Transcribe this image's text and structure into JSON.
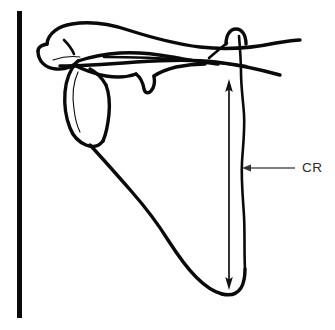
{
  "figure": {
    "background_color": "#ffffff",
    "width": 335,
    "height": 330,
    "line_color": "#0a0a0a"
  },
  "receptor": {
    "name": "image receptor",
    "color": "#0a0a0a",
    "x": 17,
    "y_top": 11,
    "y_bottom": 318,
    "thickness": 5
  },
  "annotations": {
    "cr": {
      "label": "CR",
      "label_color": "#2b2b2b",
      "label_x": 302,
      "label_y": 168,
      "leader_from_x": 295,
      "leader_to_x": 245,
      "leader_y": 168
    }
  },
  "cr_arrow": {
    "name": "central-ray-double-arrow",
    "color": "#111111",
    "x": 229,
    "y_top": 80,
    "y_bottom": 289,
    "double_headed": true
  },
  "anatomy": {
    "parts": [
      {
        "name": "clavicle",
        "label": "Clavicle"
      },
      {
        "name": "acromion",
        "label": "Acromion process"
      },
      {
        "name": "coracoid",
        "label": "Coracoid process"
      },
      {
        "name": "glenoid",
        "label": "Glenoid fossa"
      },
      {
        "name": "scapular-spine",
        "label": "Scapular spine"
      },
      {
        "name": "medial-border",
        "label": "Medial (vertebral) border"
      },
      {
        "name": "lateral-border",
        "label": "Lateral (axillary) border"
      },
      {
        "name": "inferior-angle",
        "label": "Inferior angle"
      },
      {
        "name": "superior-angle",
        "label": "Superior angle"
      }
    ]
  }
}
